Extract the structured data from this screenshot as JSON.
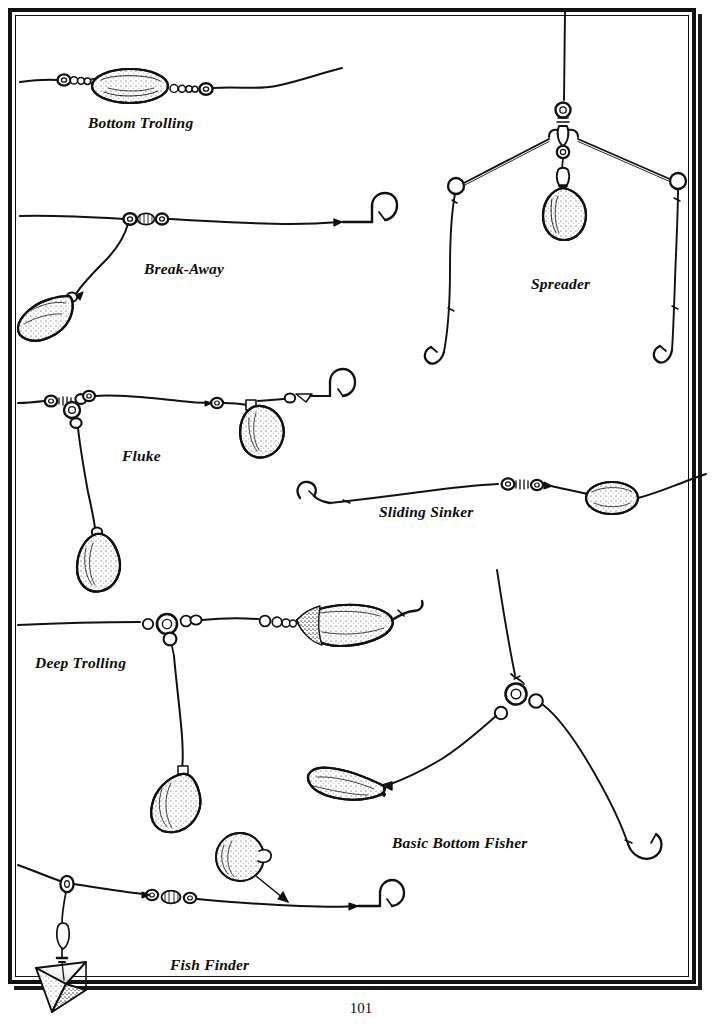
{
  "page": {
    "folio": "101",
    "width": 722,
    "height": 1024,
    "background_color": "#ffffff",
    "ink_color": "#111111",
    "border_style": "double-rule-with-drop-shadow"
  },
  "figure": {
    "style": "black-and-white pen-and-ink line drawing",
    "rigs": [
      {
        "id": "bottom-trolling",
        "label": "Bottom Trolling",
        "components": "main line, barrel swivel, bead chain, elongated egg sinker, bead chain, barrel swivel, leader"
      },
      {
        "id": "break-away",
        "label": "Break-Away",
        "components": "main line, three-way swivel with bead, dropper line to teardrop bank sinker, leader to baited hook"
      },
      {
        "id": "spreader",
        "label": "Spreader",
        "components": "vertical main line, swivel, wire spreader arms, center teardrop sinker on snap, two end rings with hooks"
      },
      {
        "id": "fluke",
        "label": "Fluke",
        "components": "main line, swivel and beads, three-way swivel, dropper to teardrop sinker, leader with second teardrop sinker and hook"
      },
      {
        "id": "sliding-sinker",
        "label": "Sliding Sinker",
        "components": "hook, leader, barrel swivel with beads, sliding egg sinker on main line"
      },
      {
        "id": "deep-trolling",
        "label": "Deep Trolling",
        "components": "main line, three-way swivel ring, dropper to teardrop sinker, beads, curved trolling lure with hook"
      },
      {
        "id": "basic-bottom-fisher",
        "label": "Basic Bottom Fisher",
        "components": "main line down to three-way swivel ring with two beads, one arm to banana sinker, one arm to baited hook"
      },
      {
        "id": "fish-finder",
        "label": "Fish Finder",
        "components": "main line through slider ring, snap and pyramid sinker, beads and barrel swivel, leader to hook, round ball sinker alternative indicated by arrow"
      }
    ]
  }
}
